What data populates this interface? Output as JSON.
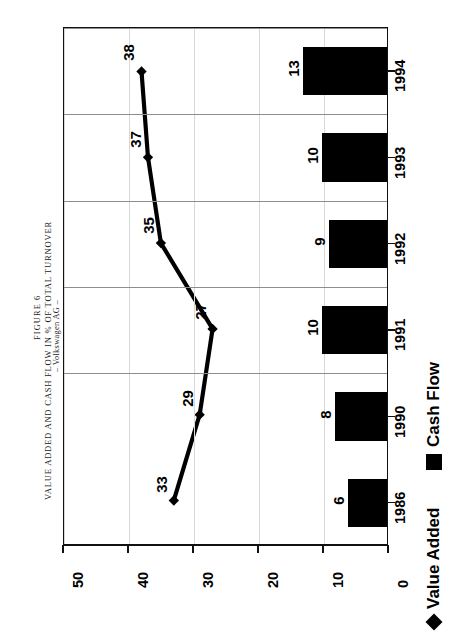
{
  "figure": {
    "number_label": "FIGURE 6",
    "title": "VALUE ADDED AND CASH FLOW IN % OF TOTAL TURNOVER",
    "subtitle": "– Volkswagen AG –"
  },
  "legend": {
    "position": "bottom-right",
    "entries": [
      {
        "label": "Value Added",
        "marker": "diamond-marker-icon",
        "color": "#000000"
      },
      {
        "label": "Cash Flow",
        "marker": "square-marker-icon",
        "color": "#000000"
      }
    ]
  },
  "axis": {
    "value_ticks": [
      "50",
      "40",
      "30",
      "20",
      "10",
      "0"
    ],
    "category_labels": [
      "1986",
      "1990",
      "1991",
      "1992",
      "1993",
      "1994"
    ]
  },
  "chart_data": {
    "type": "bar",
    "orientation": "horizontal",
    "title": "VALUE ADDED AND CASH FLOW IN % OF TOTAL TURNOVER",
    "subtitle": "– Volkswagen AG –",
    "figure_label": "FIGURE 6",
    "categories": [
      "1986",
      "1990",
      "1991",
      "1992",
      "1993",
      "1994"
    ],
    "series": [
      {
        "name": "Value Added",
        "type": "line",
        "values": [
          33,
          29,
          27,
          35,
          37,
          38
        ]
      },
      {
        "name": "Cash Flow",
        "type": "bar",
        "values": [
          6,
          8,
          10,
          9,
          10,
          13
        ]
      }
    ],
    "xlabel": "",
    "ylabel": "% of total turnover",
    "xlim": [
      0,
      50
    ],
    "ticks": [
      0,
      10,
      20,
      30,
      40,
      50
    ],
    "grid": true,
    "legend_position": "bottom-right"
  }
}
